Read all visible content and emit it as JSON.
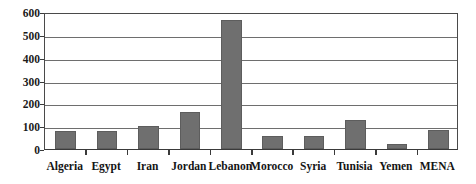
{
  "chart_data": {
    "type": "bar",
    "title": "",
    "subtitle": "",
    "xlabel": "",
    "ylabel": "",
    "categories": [
      "Algeria",
      "Egypt",
      "Iran",
      "Jordan",
      "Lebanon",
      "Morocco",
      "Syria",
      "Tunisia",
      "Yemen",
      "MENA"
    ],
    "values": [
      78,
      78,
      100,
      162,
      565,
      55,
      58,
      125,
      20,
      82
    ],
    "ylim": [
      0,
      600
    ],
    "ytick_labels": [
      "0",
      "100",
      "200",
      "300",
      "400",
      "500",
      "600"
    ],
    "ytick_values": [
      0,
      100,
      200,
      300,
      400,
      500,
      600
    ],
    "grid": true,
    "grid_axis": "y",
    "legend": false,
    "legend_position": "none",
    "series": [
      {
        "name": "",
        "values": [
          78,
          78,
          100,
          162,
          565,
          55,
          58,
          125,
          20,
          82
        ]
      }
    ]
  },
  "style": {
    "bar_color": "#6f6f6f",
    "bar_edge_color": "#5d5d5d",
    "gridline_color": "#6e6e6e",
    "frame_color": "#4a4a4a",
    "text_color": "#141414",
    "background_color": "#ffffff"
  }
}
